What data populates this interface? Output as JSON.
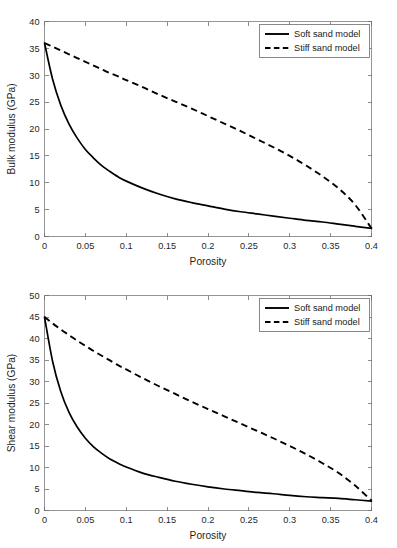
{
  "figure": {
    "background_color": "#ffffff",
    "axis_color": "#8a8a8a",
    "grid_color": "#ececec",
    "series_color": "#000000"
  },
  "chart_data": [
    {
      "id": "bulk",
      "type": "line",
      "title": "",
      "xlabel": "Porosity",
      "ylabel": "Bulk modulus (GPa)",
      "xlim": [
        0,
        0.4
      ],
      "ylim": [
        0,
        40
      ],
      "grid": true,
      "legend_position": "upper right",
      "xticks": [
        0,
        0.05,
        0.1,
        0.15,
        0.2,
        0.25,
        0.3,
        0.35,
        0.4
      ],
      "xticklabels": [
        "0",
        "0.05",
        "0.1",
        "0.15",
        "0.2",
        "0.25",
        "0.3",
        "0.35",
        "0.4"
      ],
      "yticks": [
        0,
        5,
        10,
        15,
        20,
        25,
        30,
        35,
        40
      ],
      "yticklabels": [
        "0",
        "5",
        "10",
        "15",
        "20",
        "25",
        "30",
        "35",
        "40"
      ],
      "x": [
        0,
        0.01,
        0.02,
        0.03,
        0.04,
        0.05,
        0.06,
        0.07,
        0.08,
        0.09,
        0.1,
        0.12,
        0.14,
        0.16,
        0.18,
        0.2,
        0.22,
        0.24,
        0.26,
        0.28,
        0.3,
        0.32,
        0.34,
        0.36,
        0.38,
        0.4
      ],
      "series": [
        {
          "name": "Soft sand model",
          "style": "solid",
          "values": [
            36.0,
            29.2,
            24.4,
            20.9,
            18.3,
            16.2,
            14.6,
            13.2,
            12.1,
            11.1,
            10.3,
            9.0,
            7.9,
            7.0,
            6.3,
            5.7,
            5.1,
            4.6,
            4.2,
            3.8,
            3.4,
            3.0,
            2.7,
            2.3,
            1.9,
            1.5
          ]
        },
        {
          "name": "Stiff sand model",
          "style": "dashed",
          "values": [
            36.0,
            35.3,
            34.6,
            33.9,
            33.2,
            32.5,
            31.8,
            31.1,
            30.4,
            29.8,
            29.1,
            27.8,
            26.4,
            25.1,
            23.8,
            22.4,
            21.0,
            19.6,
            18.1,
            16.6,
            15.0,
            13.2,
            11.2,
            8.9,
            5.9,
            1.5
          ]
        }
      ]
    },
    {
      "id": "shear",
      "type": "line",
      "title": "",
      "xlabel": "Porosity",
      "ylabel": "Shear modulus (GPa)",
      "xlim": [
        0,
        0.4
      ],
      "ylim": [
        0,
        50
      ],
      "grid": true,
      "legend_position": "upper right",
      "xticks": [
        0,
        0.05,
        0.1,
        0.15,
        0.2,
        0.25,
        0.3,
        0.35,
        0.4
      ],
      "xticklabels": [
        "0",
        "0.05",
        "0.1",
        "0.15",
        "0.2",
        "0.25",
        "0.3",
        "0.35",
        "0.4"
      ],
      "yticks": [
        0,
        5,
        10,
        15,
        20,
        25,
        30,
        35,
        40,
        45,
        50
      ],
      "yticklabels": [
        "0",
        "5",
        "10",
        "15",
        "20",
        "25",
        "30",
        "35",
        "40",
        "45",
        "50"
      ],
      "x": [
        0,
        0.01,
        0.02,
        0.03,
        0.04,
        0.05,
        0.06,
        0.07,
        0.08,
        0.09,
        0.1,
        0.12,
        0.14,
        0.16,
        0.18,
        0.2,
        0.22,
        0.24,
        0.26,
        0.28,
        0.3,
        0.32,
        0.34,
        0.36,
        0.38,
        0.4
      ],
      "series": [
        {
          "name": "Soft sand model",
          "style": "solid",
          "values": [
            45.0,
            34.6,
            27.6,
            22.8,
            19.4,
            16.8,
            14.8,
            13.3,
            12.0,
            11.0,
            10.1,
            8.7,
            7.7,
            6.8,
            6.1,
            5.5,
            5.0,
            4.6,
            4.2,
            3.9,
            3.5,
            3.2,
            3.0,
            2.8,
            2.5,
            2.2
          ]
        },
        {
          "name": "Stiff sand model",
          "style": "dashed",
          "values": [
            45.0,
            43.5,
            42.1,
            40.8,
            39.5,
            38.3,
            37.1,
            36.0,
            34.9,
            33.8,
            32.8,
            30.8,
            28.9,
            27.1,
            25.3,
            23.6,
            21.9,
            20.2,
            18.5,
            16.8,
            15.0,
            13.1,
            11.0,
            8.7,
            5.8,
            2.3
          ]
        }
      ]
    }
  ],
  "legend": {
    "entries": [
      {
        "label": "Soft sand model",
        "style": "solid"
      },
      {
        "label": "Stiff sand model",
        "style": "dashed"
      }
    ]
  }
}
